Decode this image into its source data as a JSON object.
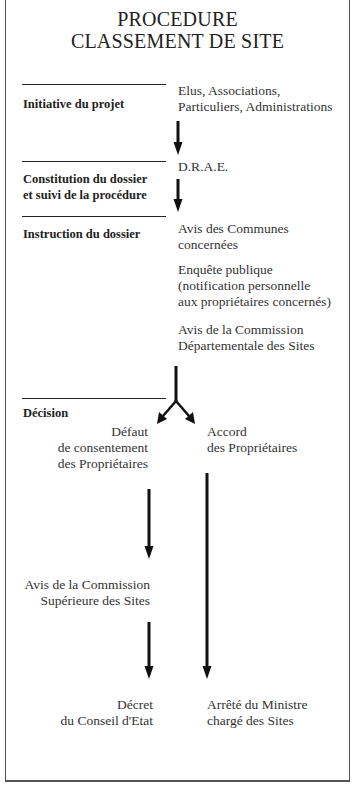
{
  "title": {
    "line1": "PROCEDURE",
    "line2": "CLASSEMENT DE SITE"
  },
  "stages": [
    {
      "label_lines": [
        "Initiative du projet"
      ],
      "actors": [
        "Elus, Associations,",
        "Particuliers, Administrations"
      ]
    },
    {
      "label_lines": [
        "Constitution du dossier",
        "et suivi de la procédure"
      ],
      "actors": [
        "D.R.A.E."
      ]
    },
    {
      "label_lines": [
        "Instruction du dossier"
      ],
      "steps": [
        [
          "Avis des Communes",
          "concernées"
        ],
        [
          "Enquête publique",
          "(notification personnelle",
          "aux propriétaires concernés)"
        ],
        [
          "Avis de la Commission",
          "Départementale des Sites"
        ]
      ]
    },
    {
      "label_lines": [
        "Décision"
      ]
    }
  ],
  "branches": {
    "left": {
      "condition": [
        "Défaut",
        "de consentement",
        "des Propriétaires"
      ],
      "intermediate": [
        "Avis de la Commission",
        "Supérieure des Sites"
      ],
      "outcome": [
        "Décret",
        "du Conseil d'Etat"
      ]
    },
    "right": {
      "condition": [
        "Accord",
        "des Propriétaires"
      ],
      "outcome": [
        "Arrêté du Ministre",
        "chargé des Sites"
      ]
    }
  },
  "colors": {
    "ink": "#1a1a1a",
    "frame": "#555555",
    "background": "#ffffff"
  }
}
